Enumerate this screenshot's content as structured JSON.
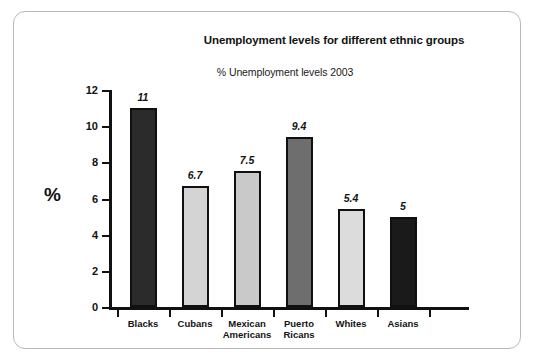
{
  "chart_data": {
    "type": "bar",
    "title": "Unemployment levels for different ethnic groups",
    "subtitle": "% Unemployment levels 2003",
    "xlabel": "",
    "ylabel": "%",
    "categories": [
      "Blacks",
      "Cubans",
      "Mexican\nAmericans",
      "Puerto\nRicans",
      "Whites",
      "Asians"
    ],
    "values": [
      11,
      6.7,
      7.5,
      9.4,
      5.4,
      5
    ],
    "value_labels": [
      "11",
      "6.7",
      "7.5",
      "9.4",
      "5.4",
      "5"
    ],
    "bar_colors": [
      "#2b2b2b",
      "#d4d4d4",
      "#c9c9c9",
      "#6e6e6e",
      "#dcdcdc",
      "#1a1a1a"
    ],
    "bar_border_color": "#101010",
    "ylim": [
      0,
      12
    ],
    "ytick_labels": [
      "0",
      "2",
      "4",
      "6",
      "8",
      "10",
      "12"
    ],
    "ytick_values": [
      0,
      2,
      4,
      6,
      8,
      10,
      12
    ],
    "grid": false,
    "legend": "none",
    "axis_color": "#111111",
    "background": "#ffffff",
    "frame_color": "#b8b8b8"
  }
}
